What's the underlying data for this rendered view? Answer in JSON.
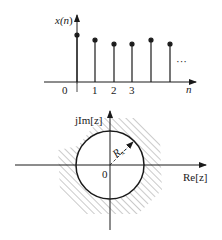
{
  "sequence_plot": {
    "y_label_prefix": "x(",
    "y_label_var": "n",
    "y_label_suffix": ")",
    "x_label": "n",
    "origin_label": "0",
    "ticks": [
      "1",
      "2",
      "3"
    ],
    "ellipsis": "···",
    "stems": [
      {
        "n": 0,
        "height": 1.0
      },
      {
        "n": 1,
        "height": 0.85
      },
      {
        "n": 2,
        "height": 0.78
      },
      {
        "n": 3,
        "height": 0.78
      },
      {
        "n": 4,
        "height": 0.85
      },
      {
        "n": 5,
        "height": 0.78
      }
    ]
  },
  "z_plane": {
    "imag_axis_label": "jIm[z]",
    "real_axis_label": "Re[z]",
    "origin_label": "0",
    "radius_label_main": "R",
    "radius_label_sub": "x−",
    "region": "outside circle |z| > Rx− (hatched)"
  }
}
